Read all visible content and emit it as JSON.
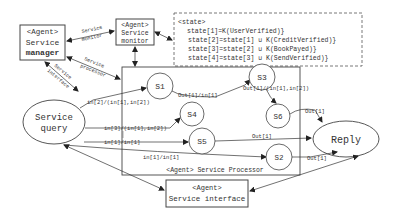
{
  "agents": {
    "manager": {
      "line1": "<Agent>",
      "line2": "Service",
      "line3": "manager"
    },
    "monitor": {
      "line1": "<Agent>",
      "line2": "Service",
      "line3": "monitor"
    },
    "interface": {
      "line1": "<Agent>",
      "line2": "Service interface"
    },
    "processor_label": "<Agent> Service Processor"
  },
  "state_box": {
    "title": "<state>",
    "lines": [
      "state[1]=K(UserVerified)}",
      "state[2]=state[1] ∪ K(CreditVerified)}",
      "state[3]=state[2] ∪ K(BookPayed)}",
      "state[4]=state[3] ∪ K(SendVerified)}"
    ]
  },
  "edge_labels": {
    "service_monitor": [
      "Service",
      "monitor"
    ],
    "service_processor": [
      "Service",
      "processor"
    ],
    "service_interface": [
      "Service",
      "interface"
    ],
    "q_s1": "in[2]/(in[1],in[2])",
    "q_s4": "in[3]/(in[1],in[2])",
    "q_s5": "in[1]/in[1]",
    "q_s2": "in[1]/in[1]",
    "s1_s3": "Out[1]/in[1]",
    "s3_s6": "Out[1]/(in[1],in[2])",
    "s6_reply": "Out[1]",
    "s5_reply": "Out[1]",
    "s2_reply": "Out[1]"
  },
  "states": {
    "s1": "S1",
    "s2": "S2",
    "s3": "S3",
    "s4": "S4",
    "s5": "S5",
    "s6": "S6"
  },
  "nodes": {
    "query": {
      "line1": "Service",
      "line2": "query"
    },
    "reply": "Reply"
  },
  "colors": {
    "stroke": "#444444",
    "text": "#333333",
    "background": "#ffffff"
  }
}
